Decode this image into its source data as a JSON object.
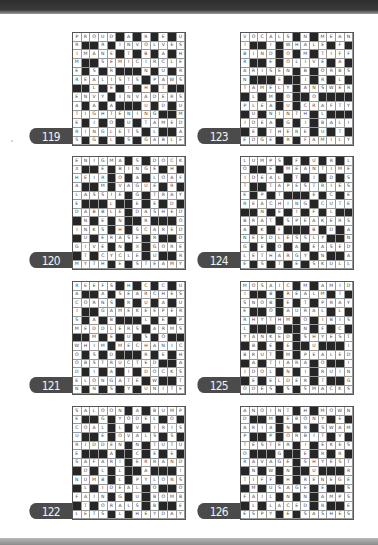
{
  "page": {
    "background": "#ffffff",
    "tab_color": "#4b4b4b",
    "black_cell_color": "#262626"
  },
  "puzzles": [
    {
      "number": "119",
      "rows": [
        "PROUD#A#R#E#U",
        "R##R#INVOLVES",
        "IMANE#T#B#A#H",
        "M##SEMICIRCLE",
        "E#S#R###N#U#R",
        "REALISTS#PAWS",
        "##L#E#I#H#T##",
        "ENVY#INVADERS",
        "A#A#A###U#D#U",
        "TIGHTENING##M",
        "E#I#O#U#TAMED",
        "RINGLETS#L##A",
        "S#G#L#S#GABLE"
      ]
    },
    {
      "number": "123",
      "rows": [
        "VOCALS#N#MEAN",
        "I##I#WHALE#F#",
        "BIND#O#M#TIFF",
        "R##E#OLIVE#A#",
        "ARISEN#B#ORBS",
        "N###E##I#R#L#",
        "TAMELY#ANSWER",
        "#L#M#O##O####",
        "PLEA#U#CRAFTY",
        "#U#NINTH#L###",
        "IDEA#G#I#BALI",
        "#E#THERE#U#T#",
        "EDGE#R#FAMILY"
      ]
    },
    {
      "number": "120",
      "rows": [
        "ENIGMA#S#DOCK",
        "X##E#BINGE#H#",
        "HEIR#O#A#LOAF",
        "A##M#VAGUE#R#",
        "LASSIE#G#TRAY",
        "E###L##E#E#D#",
        "DABBLE#DASHED",
        "#N#E#N##R###O",
        "INKS#H#SCARED",
        "#U#ERASE#R##D",
        "GIVE#N#X#GORE",
        "#T#CYCLE#U##R",
        "MYTH#E#STEAMY"
      ]
    },
    {
      "number": "124",
      "rows": [
        "LUMPS#F#U#R#L",
        "O##E#MEANTIME",
        "IDEAL#T#I#D#S",
        "T##TAPESTRIES",
        "E#P#T###E#C#E",
        "REACHING#CUTE",
        "##N#E#I#F#L##",
        "BRAT#SPEAKERS",
        "A#K#F###B#D#A",
        "NEEDLESSLY##N",
        "G#E#O#A#EASED",
        "LETHARGY#N##A",
        "E#S#T#E#SKULL"
      ]
    },
    {
      "number": "121",
      "rows": [
        "REEFS#H#C#C#U",
        "A##A#SEARCHES",
        "CORNS#R#U#A#U",
        "I##GAMEKEEPER",
        "S#A#B###L#E#P",
        "MEDDLERS#ARMS",
        "##M#E#U#S#O##",
        "WHIM#MECHANIC",
        "O#S#D###R#E#H",
        "OBSTRUCTED##A",
        "D#I#A#I#DOCKS",
        "ELONGATE#W##T",
        "N#N#S#Y#UNITE"
      ]
    },
    {
      "number": "125",
      "rows": [
        "MOSAIC#M#AMID",
        "I##B#REALM#T#",
        "SNOB#E#T#PRAY",
        "E##O#AURAL#L#",
        "RHYTHM#O#IBIS",
        "L###O##N#F#C#",
        "YANKED#SHYEST",
        "#B#E#E##U###I",
        "BRUT#M#PEALED",
        "#A#TIARA#O##I",
        "IDOL#N#I#RUIN",
        "#E#ELDER#T##G",
        "ODES#S#SMACKS"
      ]
    },
    {
      "number": "122",
      "rows": [
        "SALOON#A#BUMP",
        "E##G#YODEL#O#",
        "COAL#L#V#IRIS",
        "U##E#OVALS#S#",
        "RIDDEN#N#TUTU",
        "E###A##C#E#E#",
        "SAFARI#ERRAND",
        "#D#L#L##A###I",
        "NUMB#L#PYLONS",
        "#L#IDEAL#O##O",
        "FAIN#G#U#BOMB",
        "#T#ORALS#B##E",
        "LETS#L#HEYDAY"
      ]
    },
    {
      "number": "126",
      "rows": [
        "ANOINT#H#MOWN",
        "D##M#EBONY#E#",
        "ARIA#N#R#SWAM",
        "P##P#ORBIT#V#",
        "TESTER#I#EKES",
        "O###G##E#R#R#",
        "RAVAGE#SHYEST",
        "#N#W#N##U###R",
        "TIFF#H#RENEGE",
        "#M#USAGE#E##S",
        "FAIL#N#N#AMPS",
        "#L#LACED#R##E",
        "ESPY#E#SASHES"
      ]
    }
  ]
}
